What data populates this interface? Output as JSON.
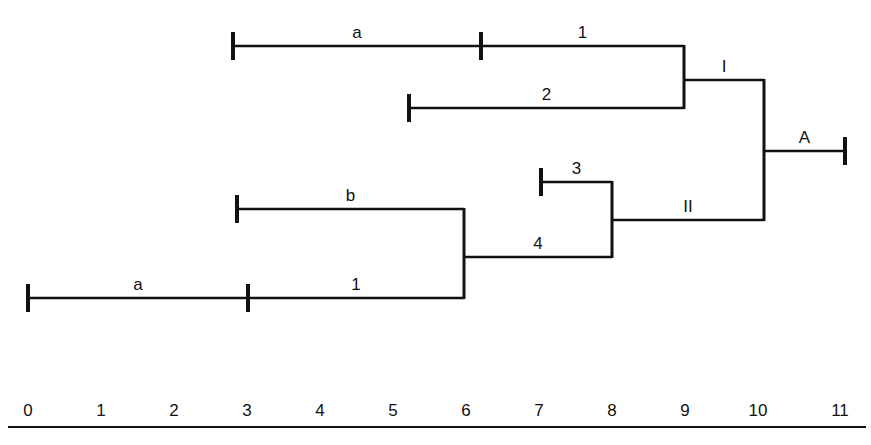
{
  "diagram": {
    "type": "dendrogram",
    "line_color": "#111111",
    "background": "#ffffff",
    "branches": [
      {
        "id": "top-a",
        "label": "a",
        "x1": 233,
        "x2": 481,
        "y": 46,
        "start_tick": true
      },
      {
        "id": "top-1",
        "label": "1",
        "x1": 481,
        "x2": 684,
        "y": 46,
        "start_tick": true
      },
      {
        "id": "top-2",
        "label": "2",
        "x1": 409,
        "x2": 684,
        "y": 108,
        "start_tick": true
      },
      {
        "id": "I",
        "label": "I",
        "x1": 684,
        "x2": 764,
        "y": 80,
        "start_tick": false
      },
      {
        "id": "A",
        "label": "A",
        "x1": 764,
        "x2": 845,
        "y": 151,
        "start_tick": false,
        "end_tick": true
      },
      {
        "id": "bot-b",
        "label": "b",
        "x1": 237,
        "x2": 464,
        "y": 209,
        "start_tick": true
      },
      {
        "id": "bot-a",
        "label": "a",
        "x1": 28,
        "x2": 248,
        "y": 298,
        "start_tick": true
      },
      {
        "id": "bot-1",
        "label": "1",
        "x1": 248,
        "x2": 464,
        "y": 298,
        "start_tick": true
      },
      {
        "id": "4",
        "label": "4",
        "x1": 464,
        "x2": 612,
        "y": 257,
        "start_tick": false
      },
      {
        "id": "3",
        "label": "3",
        "x1": 541,
        "x2": 612,
        "y": 182,
        "start_tick": true
      },
      {
        "id": "II",
        "label": "II",
        "x1": 612,
        "x2": 764,
        "y": 220,
        "start_tick": false
      }
    ],
    "joins": [
      {
        "x": 684,
        "y1": 46,
        "y2": 108
      },
      {
        "x": 764,
        "y1": 80,
        "y2": 220
      },
      {
        "x": 464,
        "y1": 209,
        "y2": 298
      },
      {
        "x": 612,
        "y1": 182,
        "y2": 257
      }
    ],
    "axis": {
      "ticks": [
        "0",
        "1",
        "2",
        "3",
        "4",
        "5",
        "6",
        "7",
        "8",
        "9",
        "10",
        "11"
      ],
      "tick_x": [
        28,
        101,
        174,
        247,
        320,
        393,
        466,
        539,
        612,
        685,
        758,
        840
      ],
      "label_y": 416,
      "line_y": 427,
      "line_x1": 8,
      "line_x2": 866
    }
  }
}
